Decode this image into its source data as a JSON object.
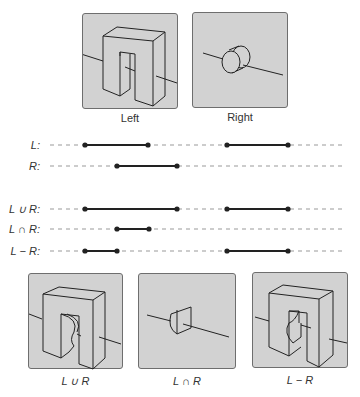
{
  "top_panels": [
    {
      "id": "left",
      "caption": "Left",
      "shape": "u-block"
    },
    {
      "id": "right",
      "caption": "Right",
      "shape": "cylinder"
    }
  ],
  "bottom_panels": [
    {
      "id": "union",
      "caption": "L ∪ R",
      "shape": "u-block-with-cylinder-added"
    },
    {
      "id": "intersection",
      "caption": "L ∩ R",
      "shape": "cylinder-section"
    },
    {
      "id": "difference",
      "caption": "L − R",
      "shape": "u-block-with-cylinder-removed"
    }
  ],
  "interval_rows": [
    {
      "label": "L:",
      "segments": [
        [
          85,
          148
        ],
        [
          227,
          288
        ]
      ]
    },
    {
      "label": "R:",
      "segments": [
        [
          117,
          177
        ]
      ]
    },
    {
      "label": "L ∪ R:",
      "segments": [
        [
          85,
          177
        ],
        [
          227,
          288
        ]
      ]
    },
    {
      "label": "L ∩ R:",
      "segments": [
        [
          117,
          149
        ]
      ]
    },
    {
      "label": "L − R:",
      "segments": [
        [
          85,
          117
        ],
        [
          227,
          288
        ]
      ]
    }
  ],
  "colors": {
    "panel_fill": "#d2d2d2",
    "panel_border": "#6e6e6e",
    "line": "#222222",
    "dash": "#999999"
  }
}
